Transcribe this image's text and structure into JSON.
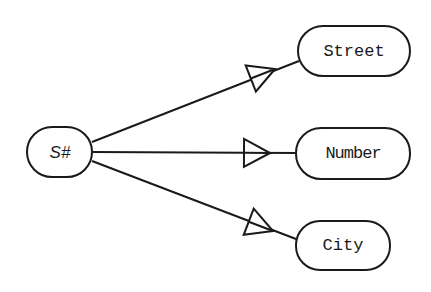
{
  "diagram": {
    "type": "functional-dependency",
    "source": {
      "id": "s",
      "label": "S#"
    },
    "targets": [
      {
        "id": "street",
        "label": "Street"
      },
      {
        "id": "number",
        "label": "Number"
      },
      {
        "id": "city",
        "label": "City"
      }
    ],
    "edges": [
      {
        "from": "s",
        "to": "street",
        "arrow": "open-triangle"
      },
      {
        "from": "s",
        "to": "number",
        "arrow": "open-triangle"
      },
      {
        "from": "s",
        "to": "city",
        "arrow": "open-triangle"
      }
    ],
    "colors": {
      "stroke": "#1a1a1a",
      "background": "#ffffff"
    }
  }
}
